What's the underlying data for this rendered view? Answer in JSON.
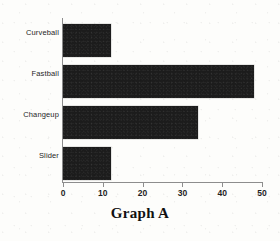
{
  "chart_data": {
    "type": "bar",
    "orientation": "horizontal",
    "title": "Graph A",
    "xlabel": "",
    "ylabel": "",
    "categories": [
      "Curveball",
      "Fastball",
      "Changeup",
      "Slider"
    ],
    "values": [
      12,
      48,
      34,
      12
    ],
    "xlim": [
      0,
      50
    ],
    "xticks": [
      0,
      10,
      20,
      30,
      40,
      50
    ],
    "xtick_labels": [
      "0",
      "10",
      "20",
      "30",
      "40",
      "50"
    ],
    "grid": false,
    "legend": false,
    "bar_color": "#1c1c1c",
    "axis_color": "#8d8d8d",
    "background_color": "#fdfdfb"
  }
}
